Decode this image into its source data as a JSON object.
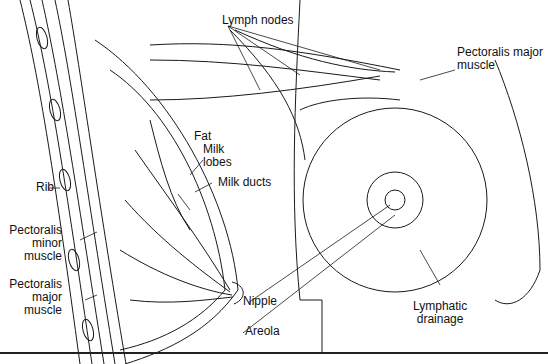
{
  "figure": {
    "labels": {
      "lymph_nodes": "Lymph nodes",
      "pectoralis_major_right": [
        "Pectoralis major",
        "muscle"
      ],
      "fat": "Fat",
      "milk_lobes": [
        "Milk",
        "lobes"
      ],
      "milk_ducts": "Milk ducts",
      "rib": "Rib",
      "pectoralis_minor": [
        "Pectoralis",
        "minor",
        "muscle"
      ],
      "pectoralis_major_left": [
        "Pectoralis",
        "major",
        "muscle"
      ],
      "nipple": "Nipple",
      "areola": "Areola",
      "lymphatic_drainage": [
        "Lymphatic",
        "drainage"
      ]
    },
    "colors": {
      "line": "#1a1a1a",
      "background": "#ffffff"
    }
  }
}
